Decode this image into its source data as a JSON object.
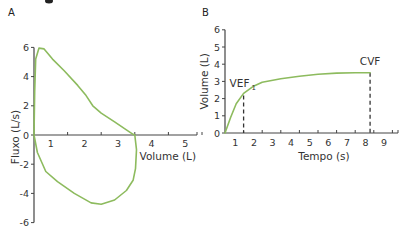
{
  "clipped_header": "",
  "curve_color": "#8dbb5e",
  "chart_data": [
    {
      "panel": "A",
      "type": "line",
      "title": "",
      "xlabel": "Volume (L)",
      "ylabel": "Fluxo (L/s)",
      "xlim": [
        0,
        5
      ],
      "ylim": [
        -6,
        6
      ],
      "x_ticks": [
        1,
        2,
        3,
        4,
        5
      ],
      "x_tick_labels": [
        "1",
        "2",
        "3",
        "4",
        "5"
      ],
      "y_ticks": [
        6,
        4,
        2,
        0,
        -2,
        -4,
        -6
      ],
      "y_tick_labels": [
        "6",
        "4",
        "2",
        "0",
        "-2",
        "-4",
        "-6"
      ],
      "grid": false,
      "series": [
        {
          "name": "flow-volume loop",
          "closed": true,
          "x": [
            0.0,
            0.02,
            0.05,
            0.15,
            0.3,
            0.55,
            0.9,
            1.3,
            1.55,
            1.75,
            2.0,
            2.4,
            2.75,
            2.95,
            3.0,
            3.05,
            3.02,
            2.95,
            2.75,
            2.4,
            2.0,
            1.7,
            1.2,
            0.7,
            0.35,
            0.1,
            0.0
          ],
          "y": [
            0.0,
            3.0,
            5.2,
            5.95,
            5.9,
            5.2,
            4.4,
            3.4,
            2.7,
            2.0,
            1.5,
            0.9,
            0.35,
            0.05,
            0.0,
            -1.0,
            -2.3,
            -3.1,
            -3.8,
            -4.45,
            -4.75,
            -4.65,
            -4.0,
            -3.2,
            -2.5,
            -1.2,
            0.0
          ]
        }
      ]
    },
    {
      "panel": "B",
      "type": "line",
      "title": "",
      "xlabel": "Tempo (s)",
      "ylabel": "Volume (L)",
      "xlim": [
        0,
        9.5
      ],
      "ylim": [
        0,
        6
      ],
      "x_ticks": [
        1,
        2,
        3,
        4,
        5,
        6,
        7,
        8,
        9
      ],
      "x_tick_labels": [
        "1",
        "2",
        "3",
        "4",
        "5",
        "6",
        "7",
        "8",
        "9"
      ],
      "y_ticks": [
        0,
        1,
        2,
        3,
        4,
        5,
        6
      ],
      "y_tick_labels": [
        "0",
        "1",
        "2",
        "3",
        "4",
        "5",
        "6"
      ],
      "grid": false,
      "series": [
        {
          "name": "volume-time curve",
          "x": [
            0.0,
            0.3,
            0.6,
            1.0,
            1.5,
            2.0,
            3.0,
            4.0,
            5.0,
            6.0,
            7.0,
            7.8
          ],
          "y": [
            0.0,
            0.9,
            1.7,
            2.3,
            2.7,
            2.95,
            3.15,
            3.3,
            3.42,
            3.48,
            3.5,
            3.5
          ]
        }
      ],
      "annotations": [
        {
          "label": "VEF",
          "subscript": "1",
          "x": 1.0,
          "y": 2.3
        },
        {
          "label": "CVF",
          "x": 7.8,
          "y": 3.5
        }
      ]
    }
  ]
}
